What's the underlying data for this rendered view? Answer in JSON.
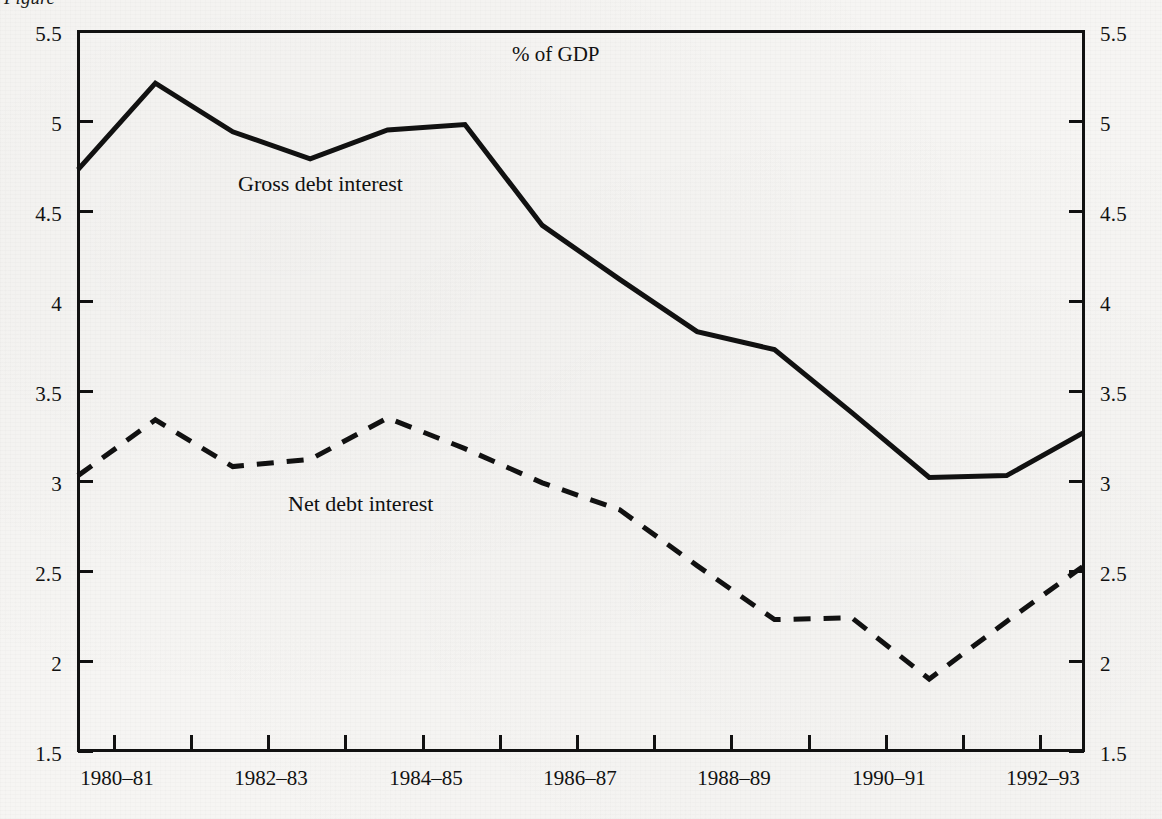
{
  "figure": {
    "unit_label": "% of GDP",
    "caption_fragment": "Figure",
    "background_color": "#f6f5f3",
    "ink_color": "#111111"
  },
  "chart_data": {
    "type": "line",
    "title": "",
    "subtitle": "",
    "xlabel": "",
    "ylabel": "% of GDP",
    "ylim": [
      1.5,
      5.5
    ],
    "yticks": [
      1.5,
      2,
      2.5,
      3,
      3.5,
      4,
      4.5,
      5,
      5.5
    ],
    "ytick_labels": [
      "1.5",
      "2",
      "2.5",
      "3",
      "3.5",
      "4",
      "4.5",
      "5",
      "5.5"
    ],
    "y_axis_right_mirrored": true,
    "grid": false,
    "legend_position": "inline-annotations",
    "x": [
      "1980–81",
      "1981–82",
      "1982–83",
      "1983–84",
      "1984–85",
      "1985–86",
      "1986–87",
      "1987–88",
      "1988–89",
      "1989–90",
      "1990–91",
      "1991–92",
      "1992–93",
      "1993–94"
    ],
    "xtick_labels": [
      "1980–81",
      "",
      "1982–83",
      "",
      "1984–85",
      "",
      "1986–87",
      "",
      "1988–89",
      "",
      "1990–91",
      "",
      "1992–93",
      ""
    ],
    "xtick_labels_shown": [
      "1980–81",
      "1982–83",
      "1984–85",
      "1986–87",
      "1988–89",
      "1990–91",
      "1992–93"
    ],
    "series": [
      {
        "name": "Gross debt interest",
        "style": "solid",
        "color": "#111111",
        "values": [
          4.73,
          5.21,
          4.94,
          4.79,
          4.95,
          4.98,
          4.42,
          4.12,
          3.83,
          3.73,
          3.38,
          3.02,
          3.03,
          3.27
        ]
      },
      {
        "name": "Net debt interest",
        "style": "dashed",
        "color": "#111111",
        "values": [
          3.03,
          3.34,
          3.08,
          3.12,
          3.35,
          3.18,
          2.99,
          2.84,
          2.53,
          2.23,
          2.24,
          1.9,
          2.22,
          2.53
        ]
      }
    ],
    "annotations": [
      {
        "text": "Gross debt interest",
        "x_value": "1982–83",
        "y_value": 4.55
      },
      {
        "text": "Net debt interest",
        "x_value": "1983–84",
        "y_value": 2.87
      },
      {
        "text": "% of GDP",
        "x_value": "1986–87",
        "y_value": 5.36
      }
    ]
  }
}
